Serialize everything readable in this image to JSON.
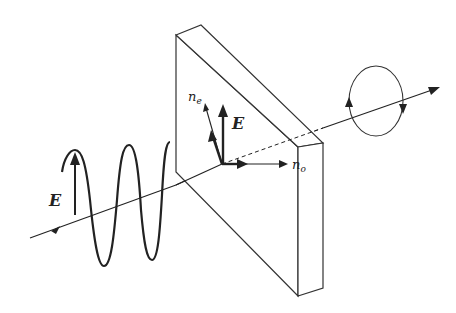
{
  "diagram": {
    "labels": {
      "incident_field": "E",
      "plate_field": "E",
      "extraordinary_axis": "n",
      "extraordinary_sub": "e",
      "ordinary_axis": "n",
      "ordinary_sub": "o"
    },
    "components": [
      {
        "id": "beam",
        "type": "propagation-axis",
        "direction": "left-to-right"
      },
      {
        "id": "incident-wave",
        "type": "sinusoid",
        "polarization": "linear-vertical"
      },
      {
        "id": "wave-plate",
        "type": "birefringent-slab"
      },
      {
        "id": "axes",
        "items": [
          "E",
          "n_e",
          "n_o"
        ]
      },
      {
        "id": "output",
        "type": "circular-polarization",
        "rotation": "clockwise"
      }
    ],
    "colors": {
      "stroke": "#222222",
      "background": "#ffffff"
    }
  }
}
